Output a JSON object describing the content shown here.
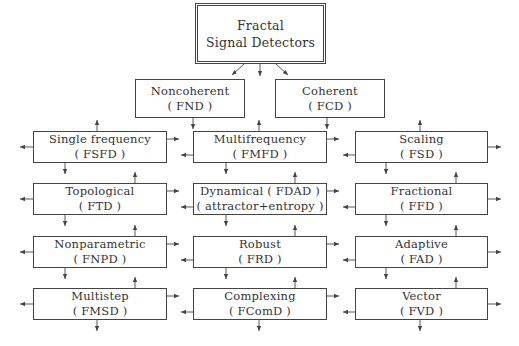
{
  "diagram": {
    "root": {
      "line1": "Fractal",
      "line2": "Signal Detectors"
    },
    "level1": [
      {
        "line1": "Noncoherent",
        "line2": "( FND )"
      },
      {
        "line1": "Coherent",
        "line2": "( FCD )"
      }
    ],
    "grid": [
      [
        {
          "line1": "Single frequency",
          "line2": "( FSFD )"
        },
        {
          "line1": "Multifrequency",
          "line2": "( FMFD )"
        },
        {
          "line1": "Scaling",
          "line2": "( FSD )"
        }
      ],
      [
        {
          "line1": "Topological",
          "line2": "( FTD )"
        },
        {
          "line1": "Dynamical ( FDAD )",
          "line2": "( attractor+entropy )"
        },
        {
          "line1": "Fractional",
          "line2": "( FFD )"
        }
      ],
      [
        {
          "line1": "Nonparametric",
          "line2": "( FNPD )"
        },
        {
          "line1": "Robust",
          "line2": "( FRD )"
        },
        {
          "line1": "Adaptive",
          "line2": "( FAD )"
        }
      ],
      [
        {
          "line1": "Multistep",
          "line2": "( FMSD )"
        },
        {
          "line1": "Complexing",
          "line2": "( FComD )"
        },
        {
          "line1": "Vector",
          "line2": "( FVD )"
        }
      ]
    ],
    "colors": {
      "line": "#444444",
      "text": "#333333",
      "background": "#ffffff"
    }
  }
}
